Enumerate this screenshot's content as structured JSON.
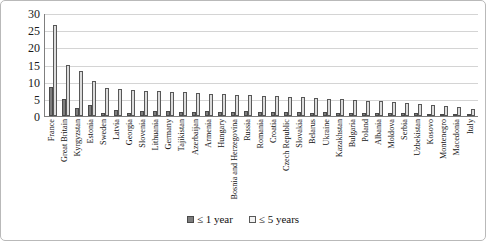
{
  "chart_data": {
    "type": "bar",
    "title": "",
    "xlabel": "",
    "ylabel": "",
    "ylim": [
      0,
      30
    ],
    "yticks": [
      0,
      5,
      10,
      15,
      20,
      25,
      30
    ],
    "grid": true,
    "legend_position": "bottom",
    "categories": [
      "France",
      "Great Britain",
      "Kyrgyzstan",
      "Estonia",
      "Sweden",
      "Latvia",
      "Georgia",
      "Slovenia",
      "Lithuania",
      "Germany",
      "Tajikistan",
      "Azerbaijan",
      "Armenia",
      "Hungary",
      "Bosnia and Herzegovina",
      "Russia",
      "Romania",
      "Croatia",
      "Czech Republic",
      "Slovakia",
      "Belarus",
      "Ukraine",
      "Kazakhstan",
      "Bulgaria",
      "Poland",
      "Albania",
      "Moldova",
      "Serbia",
      "Uzbekistan",
      "Kosovo",
      "Montenegro",
      "Macedonia",
      "Italy"
    ],
    "series": [
      {
        "name": "≤ 1 year",
        "color": "#7d7d7d",
        "values": [
          8.5,
          5.0,
          2.3,
          3.3,
          1.0,
          1.7,
          0.8,
          1.5,
          1.4,
          1.6,
          1.2,
          1.3,
          1.5,
          1.2,
          1.3,
          1.4,
          1.2,
          1.1,
          1.3,
          1.2,
          1.0,
          1.1,
          1.0,
          1.0,
          0.9,
          1.0,
          0.9,
          0.8,
          0.8,
          0.7,
          0.6,
          0.5,
          0.3
        ]
      },
      {
        "name": "≤ 5 years",
        "color": "#dcdcdc",
        "values": [
          26.5,
          15.0,
          13.2,
          10.2,
          8.3,
          8.0,
          7.6,
          7.3,
          7.2,
          7.1,
          6.9,
          6.7,
          6.5,
          6.4,
          6.2,
          6.1,
          5.9,
          5.7,
          5.6,
          5.4,
          5.2,
          5.0,
          4.9,
          4.7,
          4.5,
          4.3,
          4.1,
          3.9,
          3.6,
          3.3,
          3.0,
          2.6,
          1.9
        ]
      }
    ]
  },
  "legend": {
    "items": [
      {
        "label": "≤ 1 year",
        "swatch": "series-1-swatch"
      },
      {
        "label": "≤ 5 years",
        "swatch": "series-2-swatch"
      }
    ]
  }
}
